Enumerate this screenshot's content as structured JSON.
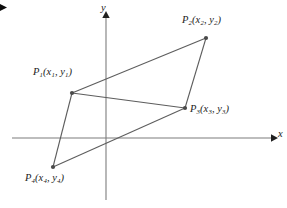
{
  "figure": {
    "type": "geometry-diagram",
    "background_color": "#ffffff",
    "line_color": "#5a5a5a",
    "axis_color": "#7a7a7a",
    "text_color": "#1c1c1c",
    "width": 287,
    "height": 208
  },
  "axes": {
    "x_axis": {
      "label": "x",
      "y_pixel": 138,
      "x_start": 12,
      "x_end": 274,
      "arrow": "right"
    },
    "y_axis": {
      "label": "y",
      "x_pixel": 106,
      "y_start": 200,
      "y_end": 14,
      "arrow": "up"
    },
    "origin": {
      "x": 106,
      "y": 138
    }
  },
  "points": [
    {
      "id": "P1",
      "label_p": "P",
      "label_sub": "1",
      "label_coords_open": "(x",
      "label_coords_sub1": "1",
      "label_coords_mid": ", y",
      "label_coords_sub2": "1",
      "label_coords_close": ")",
      "label_full": "P1(x1, y1)",
      "x": 72,
      "y": 93
    },
    {
      "id": "P2",
      "label_p": "P",
      "label_sub": "2",
      "label_coords_open": "(x",
      "label_coords_sub1": "2",
      "label_coords_mid": ", y",
      "label_coords_sub2": "2",
      "label_coords_close": ")",
      "label_full": "P2(x2, y2)",
      "x": 206,
      "y": 38
    },
    {
      "id": "P3",
      "label_p": "P",
      "label_sub": "3",
      "label_coords_open": "(x",
      "label_coords_sub1": "3",
      "label_coords_mid": ", y",
      "label_coords_sub2": "3",
      "label_coords_close": ")",
      "label_full": "P3(x3, y3)",
      "x": 185,
      "y": 108
    },
    {
      "id": "P4",
      "label_p": "P",
      "label_sub": "4",
      "label_coords_open": "(x",
      "label_coords_sub1": "4",
      "label_coords_mid": ", y",
      "label_coords_sub2": "4",
      "label_coords_close": ")",
      "label_full": "P4(x4, y4)",
      "x": 53,
      "y": 167
    }
  ],
  "edges": [
    {
      "name": "P1-P2",
      "from": "P1",
      "to": "P2"
    },
    {
      "name": "P2-P3",
      "from": "P2",
      "to": "P3"
    },
    {
      "name": "P3-P4",
      "from": "P3",
      "to": "P4"
    },
    {
      "name": "P4-P1",
      "from": "P4",
      "to": "P1"
    },
    {
      "name": "P1-P3-diagonal",
      "from": "P1",
      "to": "P3"
    }
  ]
}
